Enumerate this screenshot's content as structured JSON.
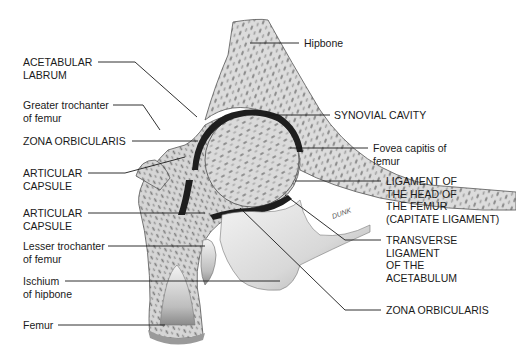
{
  "diagram": {
    "signature": "DUNK",
    "colors": {
      "background": "#ffffff",
      "ink": "#1a1a1a",
      "bone_fill": "#d9d9d9",
      "cavity": "#1e1e1e",
      "ligament_fill": "#e8e8e8"
    },
    "labels": {
      "left": [
        {
          "id": "acetabular-labrum",
          "lines": [
            "ACETABULAR",
            "LABRUM"
          ]
        },
        {
          "id": "greater-trochanter",
          "lines": [
            "Greater trochanter",
            "of femur"
          ]
        },
        {
          "id": "zona-orbicularis-left",
          "lines": [
            "ZONA ORBICULARIS"
          ]
        },
        {
          "id": "articular-capsule-upper",
          "lines": [
            "ARTICULAR",
            "CAPSULE"
          ]
        },
        {
          "id": "articular-capsule-lower",
          "lines": [
            "ARTICULAR",
            "CAPSULE"
          ]
        },
        {
          "id": "lesser-trochanter",
          "lines": [
            "Lesser trochanter",
            "of femur"
          ]
        },
        {
          "id": "ischium",
          "lines": [
            "Ischium",
            "of hipbone"
          ]
        },
        {
          "id": "femur",
          "lines": [
            "Femur"
          ]
        }
      ],
      "right": [
        {
          "id": "hipbone",
          "lines": [
            "Hipbone"
          ]
        },
        {
          "id": "synovial-cavity",
          "lines": [
            "SYNOVIAL CAVITY"
          ]
        },
        {
          "id": "fovea-capitis",
          "lines": [
            "Fovea capitis of",
            "femur"
          ]
        },
        {
          "id": "ligament-head-femur",
          "lines": [
            "LIGAMENT OF",
            "THE HEAD OF",
            "THE FEMUR",
            "(CAPITATE LIGAMENT)"
          ]
        },
        {
          "id": "transverse-ligament",
          "lines": [
            "TRANSVERSE",
            "LIGAMENT",
            "OF THE",
            "ACETABULUM"
          ]
        },
        {
          "id": "zona-orbicularis-right",
          "lines": [
            "ZONA ORBICULARIS"
          ]
        }
      ]
    }
  }
}
